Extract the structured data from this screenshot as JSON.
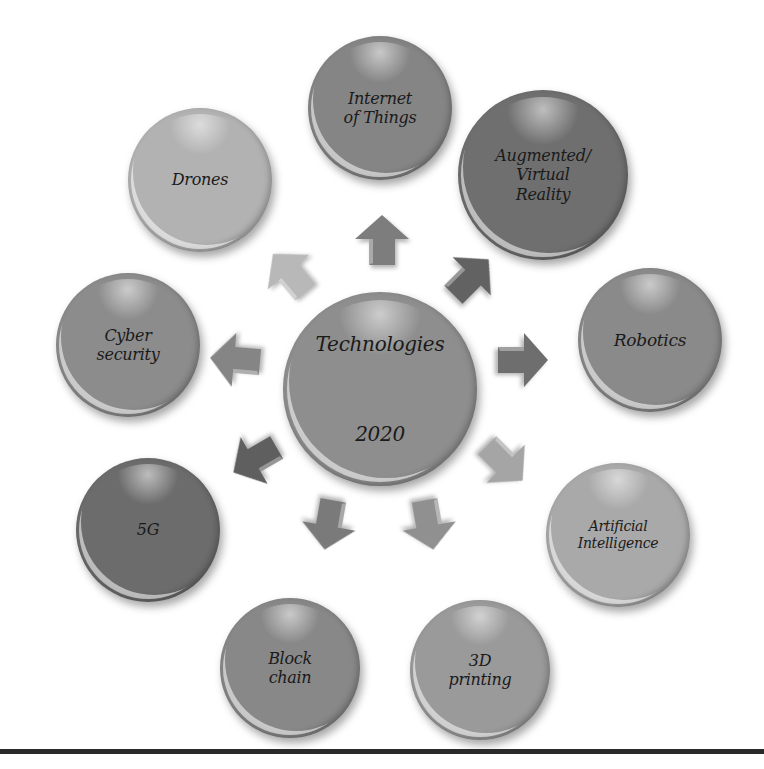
{
  "diagram": {
    "center": {
      "label": "Technologies\n\n2020",
      "line1": "Technologies",
      "line2": "2020",
      "color": "#8e8e8e",
      "cx": 380,
      "cy": 389,
      "r": 97
    },
    "nodes": [
      {
        "id": "iot",
        "label": "Internet\nof Things",
        "color": "#858585",
        "cx": 380,
        "cy": 108,
        "r": 72,
        "font": 16
      },
      {
        "id": "ar-vr",
        "label": "Augmented/\nVirtual\nReality",
        "color": "#6f6f6f",
        "cx": 543,
        "cy": 175,
        "r": 85,
        "font": 16
      },
      {
        "id": "robotics",
        "label": "Robotics",
        "color": "#8a8a8a",
        "cx": 650,
        "cy": 340,
        "r": 72,
        "font": 17
      },
      {
        "id": "ai",
        "label": "Artificial\nIntelligence",
        "color": "#a9a9a9",
        "cx": 618,
        "cy": 535,
        "r": 72,
        "font": 14
      },
      {
        "id": "3d-printing",
        "label": "3D\nprinting",
        "color": "#9a9a9a",
        "cx": 480,
        "cy": 670,
        "r": 70,
        "font": 16
      },
      {
        "id": "blockchain",
        "label": "Block\nchain",
        "color": "#888888",
        "cx": 290,
        "cy": 668,
        "r": 70,
        "font": 16
      },
      {
        "id": "5g",
        "label": "5G",
        "color": "#6c6c6c",
        "cx": 148,
        "cy": 530,
        "r": 72,
        "font": 16
      },
      {
        "id": "cyber-security",
        "label": "Cyber\nsecurity",
        "color": "#8c8c8c",
        "cx": 128,
        "cy": 345,
        "r": 72,
        "font": 16
      },
      {
        "id": "drones",
        "label": "Drones",
        "color": "#b2b2b2",
        "cx": 200,
        "cy": 180,
        "r": 72,
        "font": 16
      }
    ],
    "arrows": [
      {
        "id": "to-iot",
        "angle": 0,
        "color": "#7d7d7d",
        "x": 355,
        "y": 215
      },
      {
        "id": "to-ar-vr",
        "angle": 45,
        "color": "#626262",
        "x": 444,
        "y": 252
      },
      {
        "id": "to-robotics",
        "angle": 90,
        "color": "#6e6e6e",
        "x": 496,
        "y": 335
      },
      {
        "id": "to-ai",
        "angle": 135,
        "color": "#a5a5a5",
        "x": 478,
        "y": 438
      },
      {
        "id": "to-3d-printing",
        "angle": 170,
        "color": "#909090",
        "x": 402,
        "y": 500
      },
      {
        "id": "to-blockchain",
        "angle": 190,
        "color": "#7a7a7a",
        "x": 302,
        "y": 500
      },
      {
        "id": "to-5g",
        "angle": 240,
        "color": "#5f5f5f",
        "x": 228,
        "y": 435
      },
      {
        "id": "to-cyber-security",
        "angle": 275,
        "color": "#858585",
        "x": 208,
        "y": 335
      },
      {
        "id": "to-drones",
        "angle": 320,
        "color": "#b8b8b8",
        "x": 262,
        "y": 248
      }
    ]
  }
}
